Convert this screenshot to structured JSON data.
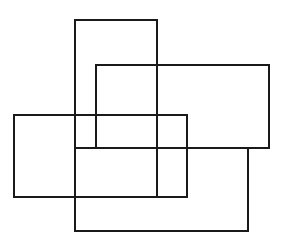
{
  "canvas": {
    "width": 284,
    "height": 246,
    "background": "#ffffff"
  },
  "stroke": {
    "color": "#1a1a1a",
    "width": 2
  },
  "rectangles": [
    {
      "id": "rect-tall-center",
      "x": 75,
      "y": 20,
      "width": 82,
      "height": 177
    },
    {
      "id": "rect-wide-upper-right",
      "x": 96,
      "y": 65,
      "width": 173,
      "height": 83
    },
    {
      "id": "rect-wide-left",
      "x": 14,
      "y": 115,
      "width": 173,
      "height": 82
    },
    {
      "id": "rect-wide-bottom",
      "x": 75,
      "y": 148,
      "width": 173,
      "height": 83
    }
  ]
}
